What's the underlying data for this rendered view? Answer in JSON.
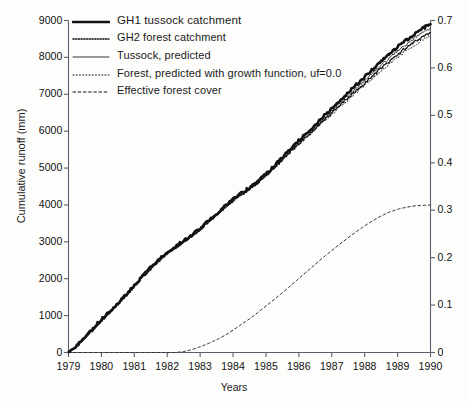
{
  "chart_data": {
    "type": "line",
    "title": "",
    "xlabel": "Years",
    "ylabel": "Cumulative runoff (mm)",
    "ylabel_right": "Effective forest cover",
    "xlim": [
      1979,
      1990
    ],
    "ylim": [
      0,
      9000
    ],
    "ylim_right": [
      0,
      0.7
    ],
    "grid": false,
    "legend_position": "top-left",
    "xticks": [
      "1979",
      "1980",
      "1981",
      "1982",
      "1983",
      "1984",
      "1985",
      "1986",
      "1987",
      "1988",
      "1989",
      "1990"
    ],
    "yticks": [
      "0",
      "1000",
      "2000",
      "3000",
      "4000",
      "5000",
      "6000",
      "7000",
      "8000",
      "9000"
    ],
    "yticks_right": [
      "0",
      "0.1",
      "0.2",
      "0.3",
      "0.4",
      "0.5",
      "0.6",
      "0.7"
    ],
    "x": [
      1979,
      1979.25,
      1979.5,
      1979.75,
      1980,
      1980.25,
      1980.5,
      1980.75,
      1981,
      1981.25,
      1981.5,
      1981.75,
      1982,
      1982.25,
      1982.5,
      1982.75,
      1983,
      1983.25,
      1983.5,
      1983.75,
      1984,
      1984.25,
      1984.5,
      1984.75,
      1985,
      1985.25,
      1985.5,
      1985.75,
      1986,
      1986.25,
      1986.5,
      1986.75,
      1987,
      1987.25,
      1987.5,
      1987.75,
      1988,
      1988.25,
      1988.5,
      1988.75,
      1989,
      1989.25,
      1989.5,
      1989.75,
      1990
    ],
    "series": [
      {
        "name": "GH1 tussock catchment",
        "style": "thick-solid",
        "axis": "left",
        "color": "#111111",
        "values": [
          0,
          180,
          420,
          640,
          900,
          1100,
          1330,
          1570,
          1820,
          2060,
          2300,
          2520,
          2720,
          2880,
          3020,
          3180,
          3360,
          3560,
          3760,
          3960,
          4160,
          4320,
          4470,
          4640,
          4840,
          5060,
          5290,
          5520,
          5740,
          5960,
          6180,
          6400,
          6620,
          6840,
          7050,
          7260,
          7470,
          7680,
          7890,
          8090,
          8280,
          8450,
          8620,
          8780,
          8900
        ]
      },
      {
        "name": "GH2 forest catchment",
        "style": "fine-dotted",
        "axis": "left",
        "color": "#111111",
        "values": [
          0,
          170,
          405,
          620,
          880,
          1080,
          1310,
          1550,
          1800,
          2040,
          2280,
          2500,
          2700,
          2860,
          3000,
          3160,
          3340,
          3540,
          3735,
          3930,
          4120,
          4280,
          4430,
          4600,
          4800,
          5010,
          5230,
          5450,
          5660,
          5870,
          6080,
          6290,
          6500,
          6710,
          6910,
          7110,
          7310,
          7510,
          7710,
          7900,
          8080,
          8250,
          8410,
          8550,
          8680
        ]
      },
      {
        "name": "Tussock, predicted",
        "style": "thin-solid",
        "axis": "left",
        "color": "#222222",
        "values": [
          0,
          165,
          400,
          615,
          870,
          1075,
          1305,
          1545,
          1790,
          2020,
          2250,
          2470,
          2670,
          2830,
          2980,
          3150,
          3330,
          3530,
          3730,
          3930,
          4125,
          4285,
          4435,
          4605,
          4805,
          5020,
          5245,
          5470,
          5685,
          5900,
          6115,
          6330,
          6545,
          6760,
          6965,
          7170,
          7375,
          7580,
          7785,
          7980,
          8165,
          8340,
          8510,
          8670,
          8800
        ]
      },
      {
        "name": "Forest, predicted with growth function, uf=0.0",
        "style": "sparse-dotted",
        "axis": "left",
        "color": "#222222",
        "values": [
          0,
          168,
          402,
          618,
          875,
          1078,
          1308,
          1548,
          1795,
          2030,
          2265,
          2485,
          2685,
          2845,
          2990,
          3155,
          3335,
          3535,
          3730,
          3925,
          4115,
          4275,
          4425,
          4595,
          4790,
          5000,
          5215,
          5430,
          5640,
          5845,
          6050,
          6255,
          6460,
          6665,
          6860,
          7055,
          7250,
          7445,
          7640,
          7825,
          8000,
          8165,
          8325,
          8465,
          8600
        ]
      },
      {
        "name": "Effective forest cover",
        "style": "dashed",
        "axis": "right",
        "color": "#333333",
        "values": [
          0,
          0,
          0,
          0,
          0,
          0,
          0,
          0,
          0,
          0,
          0,
          0,
          0,
          0,
          0.002,
          0.006,
          0.012,
          0.019,
          0.027,
          0.036,
          0.047,
          0.059,
          0.071,
          0.084,
          0.098,
          0.112,
          0.126,
          0.141,
          0.156,
          0.171,
          0.186,
          0.201,
          0.215,
          0.229,
          0.242,
          0.255,
          0.267,
          0.278,
          0.288,
          0.296,
          0.302,
          0.306,
          0.309,
          0.31,
          0.311
        ]
      }
    ]
  },
  "legend": {
    "items": [
      {
        "label": "GH1 tussock catchment",
        "style": "thick-solid"
      },
      {
        "label": "GH2 forest catchment",
        "style": "fine-dotted"
      },
      {
        "label": "Tussock, predicted",
        "style": "thin-solid"
      },
      {
        "label": "Forest, predicted with growth function, uf=0.0",
        "style": "sparse-dotted"
      },
      {
        "label": "Effective forest cover",
        "style": "dashed"
      }
    ]
  },
  "axes": {
    "left_title": "Cumulative runoff (mm)",
    "bottom_title": "Years"
  },
  "colors": {
    "axis": "#5a5f70",
    "line": "#111111",
    "background": "#fdfdfb"
  }
}
